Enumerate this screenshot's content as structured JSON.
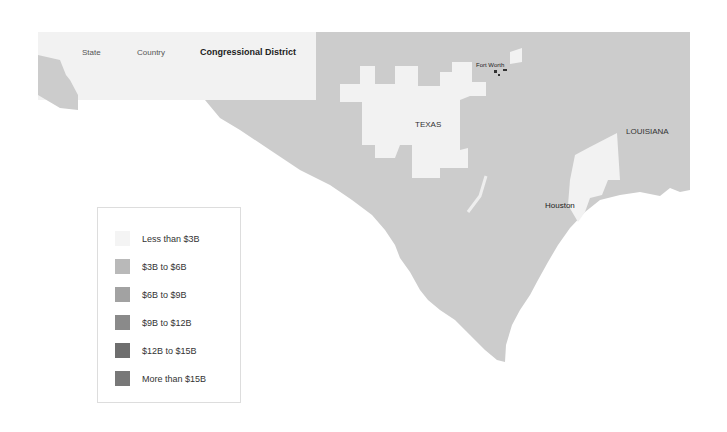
{
  "tabs": [
    {
      "label": "State",
      "active": false
    },
    {
      "label": "Country",
      "active": false
    },
    {
      "label": "Congressional District",
      "active": true
    }
  ],
  "map": {
    "labels": {
      "texas": "TEXAS",
      "louisiana": "LOUISIANA",
      "fort_worth": "Fort Worth",
      "houston": "Houston"
    },
    "colors": {
      "less_than_3b": "#f2f2f2",
      "3b_to_6b": "#cccccc",
      "water": "#ffffff"
    }
  },
  "legend": {
    "items": [
      {
        "label": "Less than $3B",
        "color": "#f4f4f4"
      },
      {
        "label": "$3B to $6B",
        "color": "#b9b9b9"
      },
      {
        "label": "$6B to $9B",
        "color": "#a2a2a2"
      },
      {
        "label": "$9B to $12B",
        "color": "#8a8a8a"
      },
      {
        "label": "$12B to $15B",
        "color": "#6e6e6e"
      },
      {
        "label": "More than $15B",
        "color": "#787878"
      }
    ]
  }
}
